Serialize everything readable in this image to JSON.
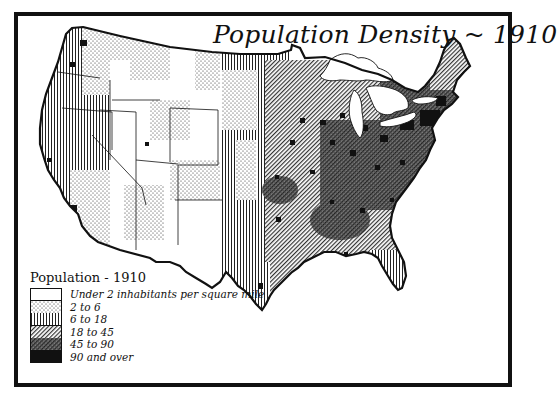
{
  "map": {
    "title": "Population Density ~ 1910",
    "subject": "United States population density by county, 1910",
    "colors": {
      "frame": "#111111",
      "background": "#ffffff",
      "ink": "#111111"
    }
  },
  "legend": {
    "title": "Population - 1910",
    "items": [
      {
        "label": "Under 2 inhabitants per square mile",
        "pattern": "white"
      },
      {
        "label": "2 to 6",
        "pattern": "dots"
      },
      {
        "label": "6 to 18",
        "pattern": "vertical-lines"
      },
      {
        "label": "18 to 45",
        "pattern": "diagonal-hatch"
      },
      {
        "label": "45 to 90",
        "pattern": "dense-crosshatch"
      },
      {
        "label": "90 and over",
        "pattern": "solid-black"
      }
    ]
  }
}
